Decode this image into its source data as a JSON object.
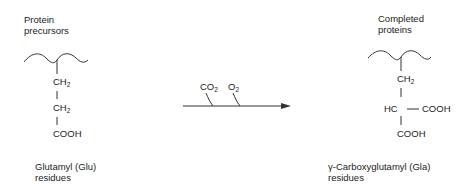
{
  "left": {
    "title_line1": "Protein",
    "title_line2": "precursors",
    "chain": [
      {
        "main": "CH",
        "sub": "2"
      },
      {
        "main": "CH",
        "sub": "2"
      },
      {
        "main": "COOH",
        "sub": ""
      }
    ],
    "caption_line1": "Glutamyl (Glu)",
    "caption_line2": "residues"
  },
  "reaction": {
    "reactants": [
      {
        "main": "CO",
        "sub": "2"
      },
      {
        "main": "O",
        "sub": "2"
      }
    ]
  },
  "right": {
    "title_line1": "Completed",
    "title_line2": "proteins",
    "chain": [
      {
        "main": "CH",
        "sub": "2"
      },
      {
        "main": "HC",
        "sub": ""
      },
      {
        "main": "COOH",
        "sub": ""
      }
    ],
    "side_group": "COOH",
    "caption_line1": "γ-Carboxyglutamyl (Gla)",
    "caption_line2": "residues"
  }
}
